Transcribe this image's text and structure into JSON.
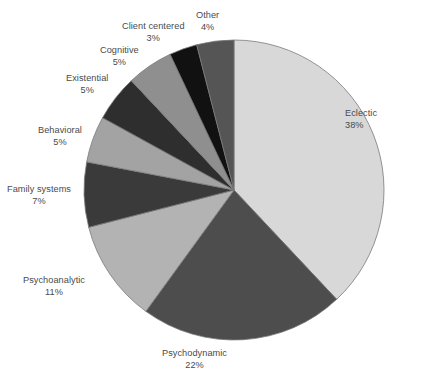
{
  "chart_data": {
    "type": "pie",
    "title": "",
    "subtitle": "",
    "xlabel": "",
    "ylabel": "",
    "legend_position": "none",
    "grid": false,
    "units": "percent",
    "start_angle_deg": 0,
    "direction": "clockwise",
    "center": {
      "x": 234,
      "y": 190
    },
    "radius": 150,
    "categories": [
      "Eclectic",
      "Psychodynamic",
      "Psychoanalytic",
      "Family systems",
      "Behavioral",
      "Existential",
      "Cognitive",
      "Client centered",
      "Other"
    ],
    "values": [
      38,
      22,
      11,
      7,
      5,
      5,
      5,
      3,
      4
    ],
    "value_labels": [
      "38%",
      "22%",
      "11%",
      "7%",
      "5%",
      "5%",
      "5%",
      "3%",
      "4%"
    ],
    "colors": [
      "#d8d8d8",
      "#4d4d4d",
      "#b3b3b3",
      "#3a3a3a",
      "#a3a3a3",
      "#2e2e2e",
      "#8f8f8f",
      "#111111",
      "#555555"
    ],
    "slices": [
      {
        "label": "Eclectic",
        "value": 38,
        "value_label": "38%",
        "color": "#d8d8d8"
      },
      {
        "label": "Psychodynamic",
        "value": 22,
        "value_label": "22%",
        "color": "#4d4d4d"
      },
      {
        "label": "Psychoanalytic",
        "value": 11,
        "value_label": "11%",
        "color": "#b3b3b3"
      },
      {
        "label": "Family systems",
        "value": 7,
        "value_label": "7%",
        "color": "#3a3a3a"
      },
      {
        "label": "Behavioral",
        "value": 5,
        "value_label": "5%",
        "color": "#a3a3a3"
      },
      {
        "label": "Existential",
        "value": 5,
        "value_label": "5%",
        "color": "#2e2e2e"
      },
      {
        "label": "Cognitive",
        "value": 5,
        "value_label": "5%",
        "color": "#8f8f8f"
      },
      {
        "label": "Client centered",
        "value": 3,
        "value_label": "3%",
        "color": "#111111"
      },
      {
        "label": "Other",
        "value": 4,
        "value_label": "4%",
        "color": "#555555"
      }
    ]
  },
  "labels": [
    {
      "name": "Eclectic",
      "pct": "38%",
      "x": 345,
      "y": 108,
      "align": "left"
    },
    {
      "name": "Psychodynamic",
      "pct": "22%",
      "x": 162,
      "y": 348,
      "align": "center"
    },
    {
      "name": "Psychoanalytic",
      "pct": "11%",
      "x": 23,
      "y": 275,
      "align": "center"
    },
    {
      "name": "Family systems",
      "pct": "7%",
      "x": 7,
      "y": 184,
      "align": "center"
    },
    {
      "name": "Behavioral",
      "pct": "5%",
      "x": 38,
      "y": 125,
      "align": "center"
    },
    {
      "name": "Existential",
      "pct": "5%",
      "x": 66,
      "y": 73,
      "align": "center"
    },
    {
      "name": "Cognitive",
      "pct": "5%",
      "x": 100,
      "y": 45,
      "align": "center"
    },
    {
      "name": "Client centered",
      "pct": "3%",
      "x": 122,
      "y": 21,
      "align": "center"
    },
    {
      "name": "Other",
      "pct": "4%",
      "x": 196,
      "y": 10,
      "align": "center"
    }
  ],
  "style": {
    "background": "#ffffff",
    "label_color": "#4a4a4a",
    "slice_stroke": "#7a7a7a"
  }
}
